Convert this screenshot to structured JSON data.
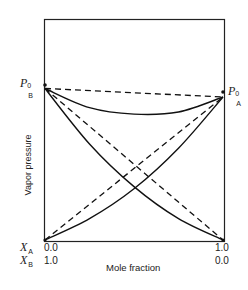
{
  "chart_data": {
    "type": "line",
    "title": "",
    "xlabel": "Mole fraction",
    "ylabel": "Vapor pressure",
    "x_axis_rows": [
      {
        "label": "X_A",
        "left": "0.0",
        "right": "1.0"
      },
      {
        "label": "X_B",
        "left": "1.0",
        "right": "0.0"
      }
    ],
    "y_markers": [
      {
        "label": "P_B^0",
        "side": "left",
        "value": 0.71
      },
      {
        "label": "P_A^0",
        "side": "right",
        "value": 0.67
      }
    ],
    "xlim": [
      0,
      1
    ],
    "ylim": [
      0,
      1
    ],
    "grid": false,
    "legend": "none",
    "x": [
      0.0,
      0.25,
      0.5,
      0.75,
      1.0
    ],
    "series": [
      {
        "name": "Ideal total pressure (dashed)",
        "style": "dashed",
        "values": [
          0.71,
          0.7,
          0.69,
          0.68,
          0.67
        ]
      },
      {
        "name": "Ideal partial pressure B (dashed)",
        "style": "dashed",
        "values": [
          0.71,
          0.53,
          0.355,
          0.18,
          0.0
        ]
      },
      {
        "name": "Ideal partial pressure A (dashed)",
        "style": "dashed",
        "values": [
          0.0,
          0.17,
          0.335,
          0.5,
          0.67
        ]
      },
      {
        "name": "Real total pressure (solid, negative deviation)",
        "style": "solid",
        "values": [
          0.71,
          0.62,
          0.59,
          0.6,
          0.67
        ]
      },
      {
        "name": "Real partial pressure B (solid)",
        "style": "solid",
        "values": [
          0.71,
          0.45,
          0.25,
          0.1,
          0.0
        ]
      },
      {
        "name": "Real partial pressure A (solid)",
        "style": "solid",
        "values": [
          0.0,
          0.1,
          0.24,
          0.43,
          0.67
        ]
      }
    ]
  },
  "labels": {
    "pb_main": "P",
    "pb_sup": "0",
    "pb_sub": "B",
    "pa_main": "P",
    "pa_sup": "0",
    "pa_sub": "A",
    "xa_main": "X",
    "xa_sub": "A",
    "xb_main": "X",
    "xb_sub": "B",
    "xa_left": "0.0",
    "xa_right": "1.0",
    "xb_left": "1.0",
    "xb_right": "0.0",
    "xlabel": "Mole fraction",
    "ylabel": "Vapor pressure"
  }
}
